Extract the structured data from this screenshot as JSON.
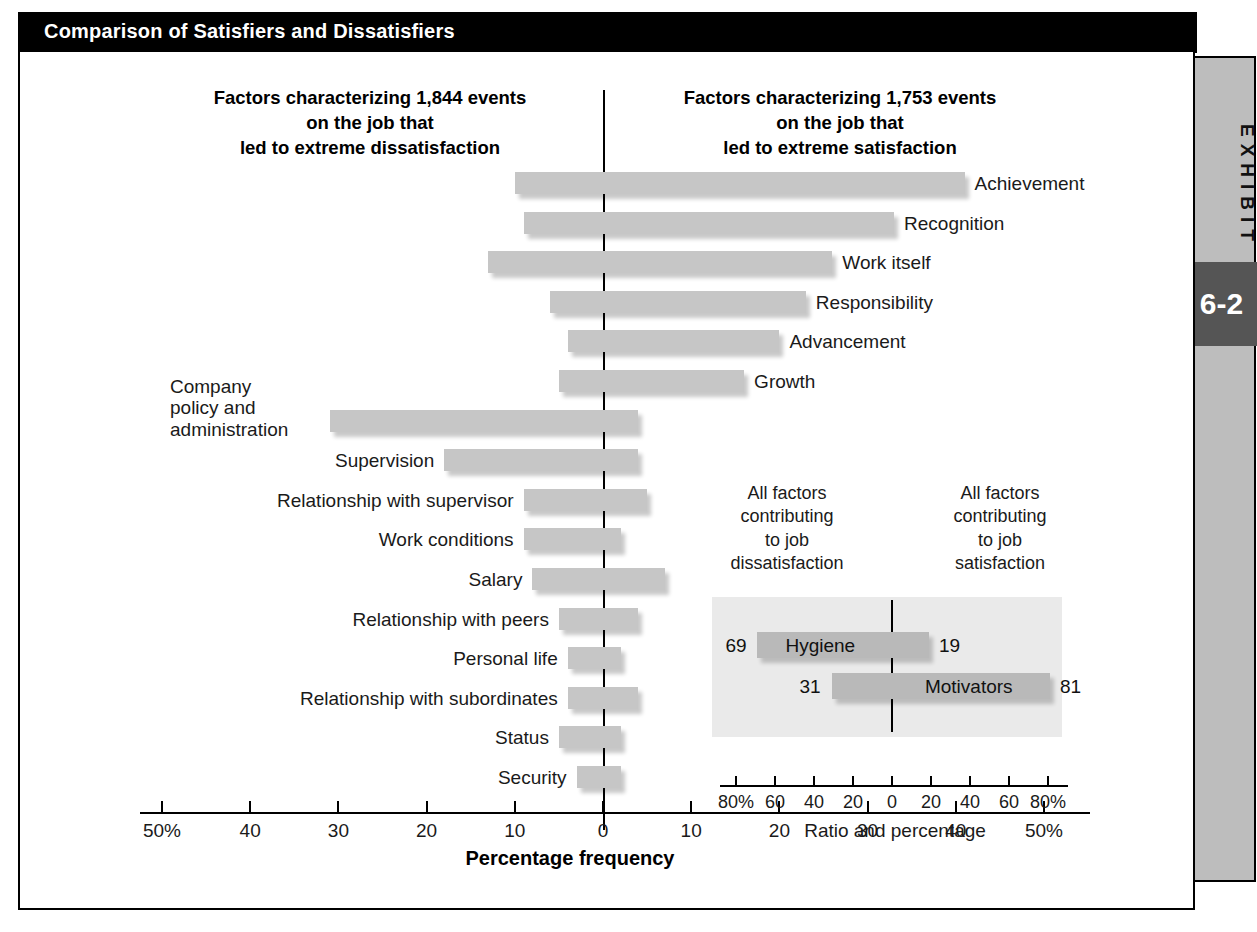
{
  "exhibit": {
    "title": "Comparison of Satisfiers and Dissatisfiers",
    "tab_label": "EXHIBIT",
    "number": "6-2"
  },
  "chart_data": {
    "type": "bar",
    "title": "Comparison of Satisfiers and Dissatisfiers",
    "orientation": "horizontal-diverging",
    "xlabel": "Percentage frequency",
    "ylabel": "",
    "xlim": [
      -50,
      50
    ],
    "xticks": [
      -50,
      -40,
      -30,
      -20,
      -10,
      0,
      10,
      20,
      30,
      40,
      50
    ],
    "xticklabels": [
      "50%",
      "40",
      "30",
      "20",
      "10",
      "0",
      "10",
      "20",
      "30",
      "40",
      "50%"
    ],
    "grid": false,
    "legend": "none",
    "heading_left": "Factors characterizing 1,844 events\non the job that\nled to extreme dissatisfaction",
    "heading_right": "Factors characterizing 1,753 events\non the job that\nled to extreme satisfaction",
    "series": [
      {
        "name": "Dissatisfaction (left of zero)",
        "note": "percentage frequency extending left from 0"
      },
      {
        "name": "Satisfaction (right of zero)",
        "note": "percentage frequency extending right from 0"
      }
    ],
    "categories": [
      "Achievement",
      "Recognition",
      "Work itself",
      "Responsibility",
      "Advancement",
      "Growth",
      "Company policy and administration",
      "Supervision",
      "Relationship with supervisor",
      "Work conditions",
      "Salary",
      "Relationship with peers",
      "Personal life",
      "Relationship with subordinates",
      "Status",
      "Security"
    ],
    "rows": [
      {
        "label": "Achievement",
        "dissatisfaction": 10,
        "satisfaction": 41,
        "label_side": "right"
      },
      {
        "label": "Recognition",
        "dissatisfaction": 9,
        "satisfaction": 33,
        "label_side": "right"
      },
      {
        "label": "Work itself",
        "dissatisfaction": 13,
        "satisfaction": 26,
        "label_side": "right"
      },
      {
        "label": "Responsibility",
        "dissatisfaction": 6,
        "satisfaction": 23,
        "label_side": "right"
      },
      {
        "label": "Advancement",
        "dissatisfaction": 4,
        "satisfaction": 20,
        "label_side": "right"
      },
      {
        "label": "Growth",
        "dissatisfaction": 5,
        "satisfaction": 16,
        "label_side": "right"
      },
      {
        "label": "Company policy and administration",
        "dissatisfaction": 31,
        "satisfaction": 4,
        "label_side": "left"
      },
      {
        "label": "Supervision",
        "dissatisfaction": 18,
        "satisfaction": 4,
        "label_side": "left"
      },
      {
        "label": "Relationship with supervisor",
        "dissatisfaction": 9,
        "satisfaction": 5,
        "label_side": "left"
      },
      {
        "label": "Work conditions",
        "dissatisfaction": 9,
        "satisfaction": 2,
        "label_side": "left"
      },
      {
        "label": "Salary",
        "dissatisfaction": 8,
        "satisfaction": 7,
        "label_side": "left"
      },
      {
        "label": "Relationship with peers",
        "dissatisfaction": 5,
        "satisfaction": 4,
        "label_side": "left"
      },
      {
        "label": "Personal life",
        "dissatisfaction": 4,
        "satisfaction": 2,
        "label_side": "left"
      },
      {
        "label": "Relationship with subordinates",
        "dissatisfaction": 4,
        "satisfaction": 4,
        "label_side": "left"
      },
      {
        "label": "Status",
        "dissatisfaction": 5,
        "satisfaction": 2,
        "label_side": "left"
      },
      {
        "label": "Security",
        "dissatisfaction": 3,
        "satisfaction": 2,
        "label_side": "left"
      }
    ],
    "inset": {
      "type": "bar",
      "heading_left": "All factors\ncontributing\nto job\ndissatisfaction",
      "heading_right": "All factors\ncontributing\nto job\nsatisfaction",
      "xlabel": "Ratio and percentage",
      "xlim": [
        -90,
        90
      ],
      "xticks": [
        -80,
        -60,
        -40,
        -20,
        0,
        20,
        40,
        60,
        80
      ],
      "xticklabels": [
        "80%",
        "60",
        "40",
        "20",
        "0",
        "20",
        "40",
        "60",
        "80%"
      ],
      "rows": [
        {
          "label": "Hygiene",
          "dissatisfaction": 69,
          "satisfaction": 19
        },
        {
          "label": "Motivators",
          "dissatisfaction": 31,
          "satisfaction": 81
        }
      ]
    }
  },
  "colors": {
    "bar": "#c6c6c6",
    "inset_bar": "#b9b9b9",
    "inset_bg": "#eaeaea",
    "title_bar": "#000000",
    "side_tab": "#bdbdbd",
    "exhibit_number_bg": "#555555"
  }
}
